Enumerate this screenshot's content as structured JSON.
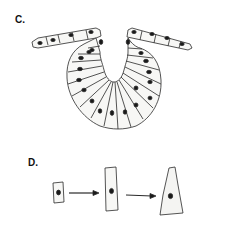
{
  "panels": {
    "c": {
      "label": "C.",
      "description": "Epithelial sheet invaginating into a U-shaped cup"
    },
    "d": {
      "label": "D.",
      "description": "Cell shape change sequence",
      "cells": [
        {
          "shape": "cuboidal"
        },
        {
          "shape": "columnar"
        },
        {
          "shape": "wedge"
        }
      ],
      "arrows": 2
    }
  },
  "colors": {
    "stroke": "#2a2a2a",
    "nucleus": "#1a1a1a",
    "cell_fill": "#f7f7f5",
    "background": "#ffffff"
  }
}
